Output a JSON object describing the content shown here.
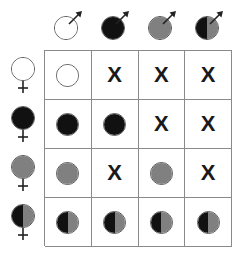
{
  "figure": {
    "name": "cross-compatibility-matrix",
    "rows": 4,
    "columns": 4
  },
  "palette": {
    "white": "#ffffff",
    "black": "#111111",
    "gray": "#808080",
    "outline": "#555555",
    "grid_line": "#8a8a8a",
    "mark": "#1a1a1a"
  },
  "column_headers": [
    {
      "id": "male-white",
      "sex": "male",
      "fill": "white",
      "left": "#ffffff",
      "right": "#ffffff",
      "icon": "male-symbol-icon"
    },
    {
      "id": "male-black",
      "sex": "male",
      "fill": "black",
      "left": "#111111",
      "right": "#111111",
      "icon": "male-symbol-icon"
    },
    {
      "id": "male-gray",
      "sex": "male",
      "fill": "gray",
      "left": "#808080",
      "right": "#808080",
      "icon": "male-symbol-icon"
    },
    {
      "id": "male-half",
      "sex": "male",
      "fill": "half",
      "left": "#111111",
      "right": "#808080",
      "icon": "male-symbol-icon"
    }
  ],
  "row_headers": [
    {
      "id": "female-white",
      "sex": "female",
      "fill": "white",
      "left": "#ffffff",
      "right": "#ffffff",
      "icon": "female-symbol-icon"
    },
    {
      "id": "female-black",
      "sex": "female",
      "fill": "black",
      "left": "#111111",
      "right": "#111111",
      "icon": "female-symbol-icon"
    },
    {
      "id": "female-gray",
      "sex": "female",
      "fill": "gray",
      "left": "#808080",
      "right": "#808080",
      "icon": "female-symbol-icon"
    },
    {
      "id": "female-half",
      "sex": "female",
      "fill": "half",
      "left": "#111111",
      "right": "#808080",
      "icon": "female-symbol-icon"
    }
  ],
  "cross_mark": "X",
  "cells": [
    [
      {
        "type": "disc",
        "fill": "white",
        "left": "#ffffff",
        "right": "#ffffff"
      },
      {
        "type": "mark",
        "label": "X"
      },
      {
        "type": "mark",
        "label": "X"
      },
      {
        "type": "mark",
        "label": "X"
      }
    ],
    [
      {
        "type": "disc",
        "fill": "black",
        "left": "#111111",
        "right": "#111111"
      },
      {
        "type": "disc",
        "fill": "black",
        "left": "#111111",
        "right": "#111111"
      },
      {
        "type": "mark",
        "label": "X"
      },
      {
        "type": "mark",
        "label": "X"
      }
    ],
    [
      {
        "type": "disc",
        "fill": "gray",
        "left": "#808080",
        "right": "#808080"
      },
      {
        "type": "mark",
        "label": "X"
      },
      {
        "type": "disc",
        "fill": "gray",
        "left": "#808080",
        "right": "#808080"
      },
      {
        "type": "mark",
        "label": "X"
      }
    ],
    [
      {
        "type": "disc",
        "fill": "half",
        "left": "#111111",
        "right": "#808080"
      },
      {
        "type": "disc",
        "fill": "half",
        "left": "#111111",
        "right": "#808080"
      },
      {
        "type": "disc",
        "fill": "half",
        "left": "#111111",
        "right": "#808080"
      },
      {
        "type": "disc",
        "fill": "half",
        "left": "#111111",
        "right": "#808080"
      }
    ]
  ]
}
